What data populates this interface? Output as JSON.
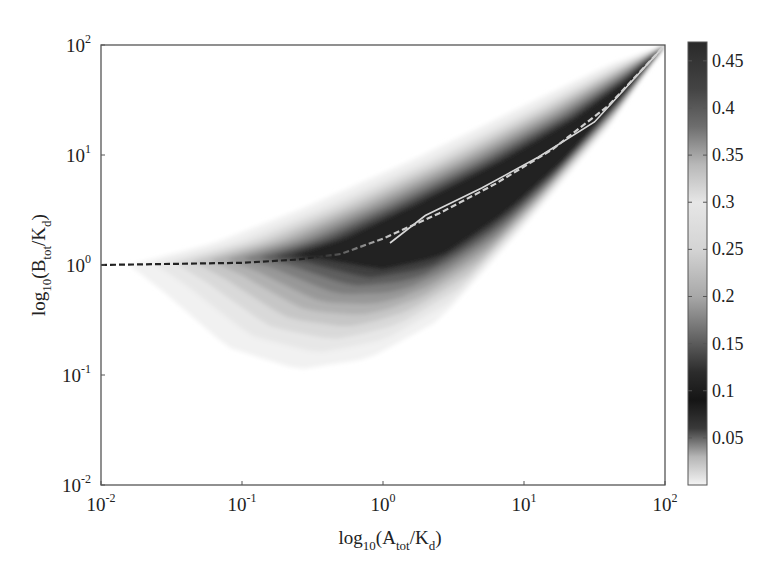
{
  "chart_data": {
    "type": "heatmap",
    "subtype": "filled-contour",
    "title": "",
    "xlabel": {
      "base": "log",
      "sub1": "10",
      "mid": "(A",
      "sub2": "tot",
      "mid2": "/K",
      "sub3": "d",
      "end": ")"
    },
    "ylabel": {
      "base": "log",
      "sub1": "10",
      "mid": "(B",
      "sub2": "tot",
      "mid2": "/K",
      "sub3": "d",
      "end": ")"
    },
    "xlabel_text": "log10(Atot/Kd)",
    "ylabel_text": "log10(Btot/Kd)",
    "x_scale": "log",
    "y_scale": "log",
    "xlim": [
      0.01,
      100
    ],
    "ylim": [
      0.01,
      100
    ],
    "x_ticks": [
      {
        "base": "10",
        "exp": "-2",
        "value": -2
      },
      {
        "base": "10",
        "exp": "-1",
        "value": -1
      },
      {
        "base": "10",
        "exp": "0",
        "value": 0
      },
      {
        "base": "10",
        "exp": "1",
        "value": 1
      },
      {
        "base": "10",
        "exp": "2",
        "value": 2
      }
    ],
    "y_ticks": [
      {
        "base": "10",
        "exp": "2",
        "value": 2
      },
      {
        "base": "10",
        "exp": "1",
        "value": 1
      },
      {
        "base": "10",
        "exp": "0",
        "value": 0
      },
      {
        "base": "10",
        "exp": "-1",
        "value": -1
      },
      {
        "base": "10",
        "exp": "-2",
        "value": -2
      }
    ],
    "colorbar": {
      "ticks": [
        "0.45",
        "0.4",
        "0.35",
        "0.3",
        "0.25",
        "0.2",
        "0.15",
        "0.1",
        "0.05"
      ],
      "tick_values": [
        0.45,
        0.4,
        0.35,
        0.3,
        0.25,
        0.2,
        0.15,
        0.1,
        0.05
      ],
      "range": [
        0,
        0.47
      ],
      "colormap_stops": [
        {
          "v": 0.0,
          "color": "#f4f4f4"
        },
        {
          "v": 0.03,
          "color": "#b5b5b5"
        },
        {
          "v": 0.06,
          "color": "#3a3a3a"
        },
        {
          "v": 0.09,
          "color": "#151515"
        },
        {
          "v": 0.12,
          "color": "#2c2c2c"
        },
        {
          "v": 0.16,
          "color": "#6a6a6a"
        },
        {
          "v": 0.2,
          "color": "#a8a8a8"
        },
        {
          "v": 0.25,
          "color": "#d4d4d4"
        },
        {
          "v": 0.3,
          "color": "#e6e6e6"
        },
        {
          "v": 0.34,
          "color": "#b8b8b8"
        },
        {
          "v": 0.38,
          "color": "#6e6e6e"
        },
        {
          "v": 0.42,
          "color": "#444444"
        },
        {
          "v": 0.47,
          "color": "#2a2a2a"
        }
      ]
    },
    "bands": [
      {
        "level": 0.02,
        "color": "#f1f1f1"
      },
      {
        "level": 0.05,
        "color": "#e7e7e7"
      },
      {
        "level": 0.08,
        "color": "#d9d9d9"
      },
      {
        "level": 0.12,
        "color": "#c6c6c6"
      },
      {
        "level": 0.16,
        "color": "#b0b0b0"
      },
      {
        "level": 0.2,
        "color": "#989898"
      },
      {
        "level": 0.25,
        "color": "#7e7e7e"
      },
      {
        "level": 0.3,
        "color": "#5f5f5f"
      },
      {
        "level": 0.36,
        "color": "#404040"
      },
      {
        "level": 0.42,
        "color": "#242424"
      }
    ],
    "lines": [
      {
        "name": "solid-line",
        "style": "solid",
        "color": "#d8d8d8",
        "points_log": [
          [
            0.05,
            0.2
          ],
          [
            0.3,
            0.45
          ],
          [
            0.7,
            0.7
          ],
          [
            1.1,
            0.98
          ],
          [
            1.5,
            1.3
          ],
          [
            2.0,
            2.0
          ]
        ]
      },
      {
        "name": "dashed-line",
        "style": "dashed",
        "color_left": "#222222",
        "color_right": "#cfcfcf",
        "points_log": [
          [
            -2.0,
            0.0
          ],
          [
            -1.0,
            0.02
          ],
          [
            -0.6,
            0.05
          ],
          [
            -0.3,
            0.1
          ],
          [
            0.0,
            0.24
          ],
          [
            0.4,
            0.47
          ],
          [
            0.8,
            0.74
          ],
          [
            1.2,
            1.05
          ],
          [
            1.6,
            1.45
          ],
          [
            2.0,
            2.0
          ]
        ]
      }
    ]
  }
}
